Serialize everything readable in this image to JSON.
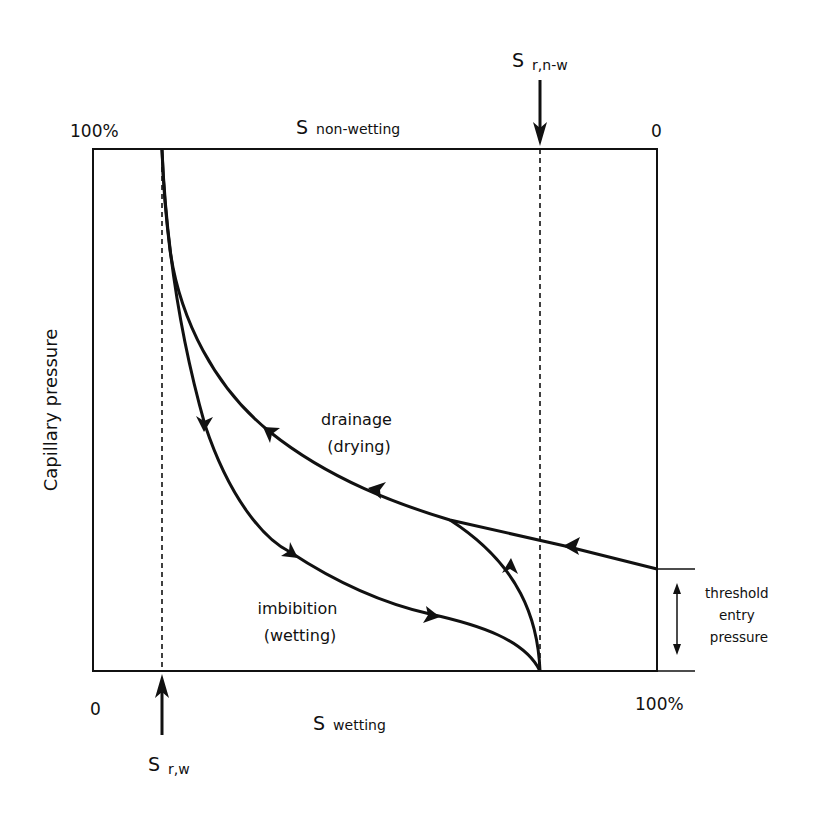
{
  "diagram": {
    "title_fragment": "",
    "top_axis": {
      "label_main": "S",
      "label_sub": "non-wetting",
      "left_value": "100%",
      "right_value": "0"
    },
    "bottom_axis": {
      "label_main": "S",
      "label_sub": "wetting",
      "left_value": "0",
      "right_value": "100%"
    },
    "y_axis_label": "Capillary pressure",
    "markers": {
      "residual_wetting": {
        "main": "S",
        "sub": "r,w"
      },
      "residual_nonwetting": {
        "main": "S",
        "sub": "r,n-w"
      }
    },
    "curves": {
      "drainage": {
        "line1": "drainage",
        "line2": "(drying)"
      },
      "imbibition": {
        "line1": "imbibition",
        "line2": "(wetting)"
      }
    },
    "threshold": {
      "line1": "threshold",
      "line2": "entry",
      "line3": "pressure"
    },
    "colors": {
      "line": "#111111",
      "background": "#ffffff"
    }
  }
}
